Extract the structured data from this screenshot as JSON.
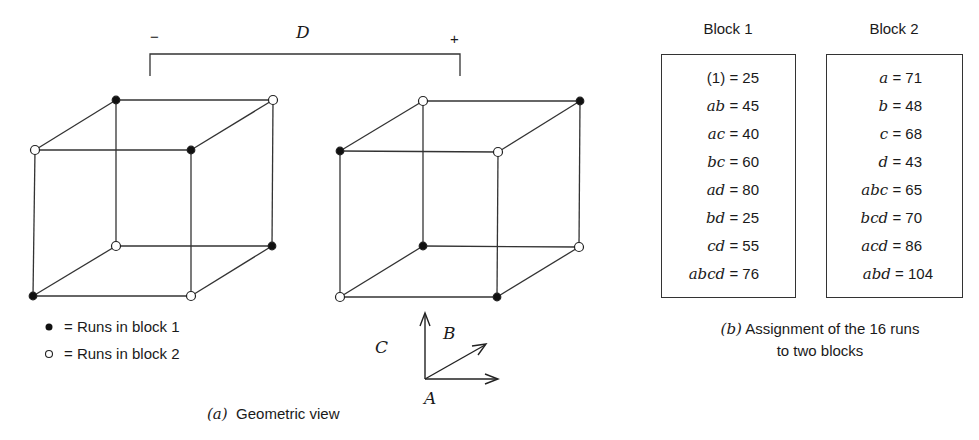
{
  "geometric_view": {
    "factor_label": "D",
    "minus_label": "−",
    "plus_label": "+",
    "caption_letter": "(a)",
    "caption_text": "Geometric view",
    "axes": {
      "a": "A",
      "b": "B",
      "c": "C"
    },
    "legend": [
      {
        "marker": "filled",
        "text": "= Runs in block 1"
      },
      {
        "marker": "open",
        "text": "= Runs in block 2"
      }
    ],
    "cubes": [
      {
        "name": "D-minus",
        "vertices": [
          {
            "pos": "front-top-left",
            "block": 2
          },
          {
            "pos": "front-top-right",
            "block": 1
          },
          {
            "pos": "back-top-left",
            "block": 1
          },
          {
            "pos": "back-top-right",
            "block": 2
          },
          {
            "pos": "front-bottom-left",
            "block": 1
          },
          {
            "pos": "front-bottom-right",
            "block": 2
          },
          {
            "pos": "back-bottom-left",
            "block": 2
          },
          {
            "pos": "back-bottom-right",
            "block": 1
          }
        ]
      },
      {
        "name": "D-plus",
        "vertices": [
          {
            "pos": "front-top-left",
            "block": 1
          },
          {
            "pos": "front-top-right",
            "block": 2
          },
          {
            "pos": "back-top-left",
            "block": 2
          },
          {
            "pos": "back-top-right",
            "block": 1
          },
          {
            "pos": "front-bottom-left",
            "block": 2
          },
          {
            "pos": "front-bottom-right",
            "block": 1
          },
          {
            "pos": "back-bottom-left",
            "block": 1
          },
          {
            "pos": "back-bottom-right",
            "block": 2
          }
        ]
      }
    ]
  },
  "blocks": [
    {
      "title": "Block 1",
      "runs": [
        {
          "label": "(1)",
          "value": "= 25"
        },
        {
          "label": "ab",
          "value": "= 45"
        },
        {
          "label": "ac",
          "value": "= 40"
        },
        {
          "label": "bc",
          "value": "= 60"
        },
        {
          "label": "ad",
          "value": "= 80"
        },
        {
          "label": "bd",
          "value": "= 25"
        },
        {
          "label": "cd",
          "value": "= 55"
        },
        {
          "label": "abcd",
          "value": "= 76"
        }
      ]
    },
    {
      "title": "Block 2",
      "runs": [
        {
          "label": "a",
          "value": "= 71"
        },
        {
          "label": "b",
          "value": "= 48"
        },
        {
          "label": "c",
          "value": "= 68"
        },
        {
          "label": "d",
          "value": "= 43"
        },
        {
          "label": "abc",
          "value": "= 65"
        },
        {
          "label": "bcd",
          "value": "= 70"
        },
        {
          "label": "acd",
          "value": "= 86"
        },
        {
          "label": "abd",
          "value": "= 104"
        }
      ]
    }
  ],
  "assignment_caption": {
    "letter": "(b)",
    "line1": "Assignment of the 16 runs",
    "line2": "to two blocks"
  }
}
